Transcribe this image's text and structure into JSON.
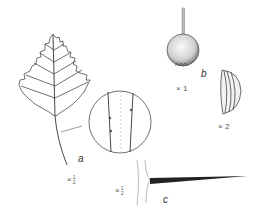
{
  "figure": {
    "parts": [
      {
        "id": "a",
        "label": "a",
        "subject": "leaf with enlarged detail of hairy petiole",
        "scale_prefix": "×",
        "scale_num": "1",
        "scale_den": "2"
      },
      {
        "id": "b",
        "label": "b",
        "subject": "fruit",
        "scale": "× 1"
      },
      {
        "id": "b2",
        "subject": "nutlet",
        "scale": "× 2"
      },
      {
        "id": "c",
        "label": "c",
        "subject": "thorn on branch",
        "scale_prefix": "×",
        "scale_num": "1",
        "scale_den": "2"
      }
    ],
    "colors": {
      "ink": "#333333",
      "background": "#ffffff"
    }
  }
}
